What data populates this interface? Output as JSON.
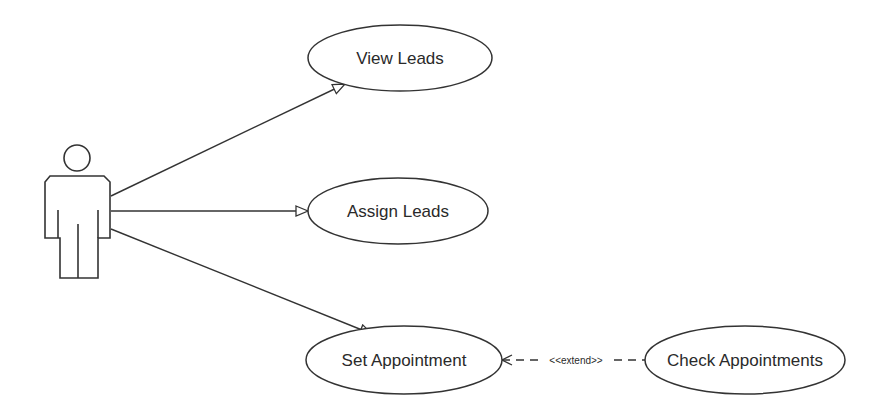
{
  "diagram": {
    "type": "use-case",
    "actor": {
      "label": ""
    },
    "use_cases": [
      {
        "id": "view",
        "label": "View Leads"
      },
      {
        "id": "assign",
        "label": "Assign Leads"
      },
      {
        "id": "set",
        "label": "Set Appointment"
      },
      {
        "id": "check",
        "label": "Check Appointments"
      }
    ],
    "relations": [
      {
        "from": "actor",
        "to": "view",
        "kind": "association"
      },
      {
        "from": "actor",
        "to": "assign",
        "kind": "association"
      },
      {
        "from": "actor",
        "to": "set",
        "kind": "association"
      },
      {
        "from": "check",
        "to": "set",
        "kind": "extend",
        "label": "<<extend>>"
      }
    ],
    "colors": {
      "stroke": "#333333",
      "background": "#ffffff"
    }
  }
}
